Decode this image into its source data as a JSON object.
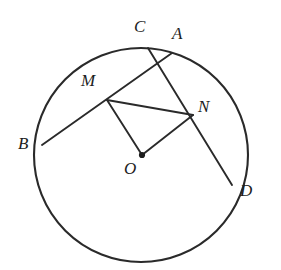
{
  "figure": {
    "type": "circle-geometry-diagram",
    "canvas": {
      "width": 281,
      "height": 270
    },
    "style": {
      "background_color": "#ffffff",
      "stroke_color": "#2a2a2a",
      "label_color": "#1d1d1d",
      "circle_stroke_width": 2.1,
      "chord_stroke_width": 1.9,
      "segment_stroke_width": 1.9
    },
    "circle": {
      "name": "main-circle",
      "center_x": 141,
      "center_y": 155,
      "radius": 107
    },
    "center_point": {
      "name": "O",
      "x": 142,
      "y": 155,
      "dot_radius": 3.1
    },
    "points": [
      {
        "name": "C",
        "x": 148,
        "y": 48,
        "on_circle": true
      },
      {
        "name": "A",
        "x": 172,
        "y": 53,
        "on_circle": true
      },
      {
        "name": "B",
        "x": 42,
        "y": 145,
        "on_circle": true
      },
      {
        "name": "D",
        "x": 232,
        "y": 185,
        "on_circle": true
      },
      {
        "name": "M",
        "x": 107,
        "y": 100,
        "on_circle": false
      },
      {
        "name": "N",
        "x": 193,
        "y": 115,
        "on_circle": false
      },
      {
        "name": "O",
        "x": 142,
        "y": 155,
        "on_circle": false
      }
    ],
    "chords": [
      {
        "name": "chord-BA",
        "from": "B",
        "to": "A",
        "x1": 42,
        "y1": 145,
        "x2": 172,
        "y2": 53,
        "through": "M"
      },
      {
        "name": "chord-CD",
        "from": "C",
        "to": "D",
        "x1": 148,
        "y1": 48,
        "x2": 232,
        "y2": 185,
        "through": "N"
      }
    ],
    "segments": [
      {
        "name": "segment-MN",
        "from": "M",
        "to": "N",
        "x1": 107,
        "y1": 100,
        "x2": 193,
        "y2": 115
      },
      {
        "name": "segment-MO",
        "from": "M",
        "to": "O",
        "x1": 107,
        "y1": 100,
        "x2": 142,
        "y2": 155
      },
      {
        "name": "segment-NO",
        "from": "N",
        "to": "O",
        "x1": 193,
        "y1": 115,
        "x2": 142,
        "y2": 155
      }
    ],
    "labels": [
      {
        "key": "C",
        "text": "C",
        "x": 134,
        "y": 18
      },
      {
        "key": "A",
        "text": "A",
        "x": 172,
        "y": 25
      },
      {
        "key": "M",
        "text": "M",
        "x": 81,
        "y": 72
      },
      {
        "key": "N",
        "text": "N",
        "x": 198,
        "y": 98
      },
      {
        "key": "B",
        "text": "B",
        "x": 18,
        "y": 135
      },
      {
        "key": "O",
        "text": "O",
        "x": 124,
        "y": 160
      },
      {
        "key": "D",
        "text": "D",
        "x": 240,
        "y": 182
      }
    ]
  }
}
